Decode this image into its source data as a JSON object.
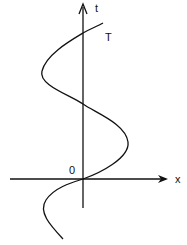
{
  "diagram": {
    "axis_labels": {
      "vertical": "t",
      "horizontal": "x"
    },
    "origin_label": "0",
    "period_label": "T",
    "colors": {
      "stroke": "#111111",
      "background": "#ffffff"
    }
  }
}
